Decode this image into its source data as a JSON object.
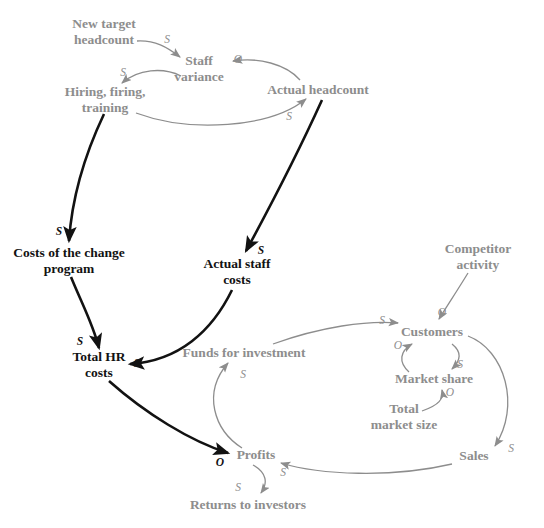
{
  "diagram": {
    "colors": {
      "gray": "#8d8d8d",
      "black": "#121212",
      "background": "#ffffff"
    },
    "nodes": [
      {
        "id": "new-target-headcount",
        "label": "New target\nheadcount",
        "x": 104,
        "y": 32,
        "style": "gray"
      },
      {
        "id": "staff-variance",
        "label": "Staff\nvariance",
        "x": 199,
        "y": 69,
        "style": "gray"
      },
      {
        "id": "actual-headcount",
        "label": "Actual headcount",
        "x": 318,
        "y": 90,
        "style": "gray"
      },
      {
        "id": "hiring-firing-training",
        "label": "Hiring, firing,\ntraining",
        "x": 105,
        "y": 100,
        "style": "gray"
      },
      {
        "id": "costs-of-the-change-program",
        "label": "Costs of the change\nprogram",
        "x": 69,
        "y": 261,
        "style": "black"
      },
      {
        "id": "actual-staff-costs",
        "label": "Actual staff\ncosts",
        "x": 237,
        "y": 272,
        "style": "black"
      },
      {
        "id": "competitor-activity",
        "label": "Competitor\nactivity",
        "x": 478,
        "y": 257,
        "style": "gray"
      },
      {
        "id": "customers",
        "label": "Customers",
        "x": 432,
        "y": 332,
        "style": "gray"
      },
      {
        "id": "funds-for-investment",
        "label": "Funds for investment",
        "x": 244,
        "y": 353,
        "style": "gray"
      },
      {
        "id": "total-hr-costs",
        "label": "Total HR\ncosts",
        "x": 99,
        "y": 365,
        "style": "black"
      },
      {
        "id": "market-share",
        "label": "Market share",
        "x": 434,
        "y": 379,
        "style": "gray"
      },
      {
        "id": "total-market-size",
        "label": "Total\nmarket size",
        "x": 404,
        "y": 417,
        "style": "gray"
      },
      {
        "id": "sales",
        "label": "Sales",
        "x": 474,
        "y": 456,
        "style": "gray"
      },
      {
        "id": "profits",
        "label": "Profits",
        "x": 256,
        "y": 455,
        "style": "gray"
      },
      {
        "id": "returns-to-investors",
        "label": "Returns to investors",
        "x": 248,
        "y": 505,
        "style": "gray"
      }
    ],
    "edges": [
      {
        "id": "new-target-headcount-to-staff-variance",
        "from": "new-target-headcount",
        "to": "staff-variance",
        "polarity": "S",
        "style": "gray",
        "label_x": 167,
        "label_y": 39
      },
      {
        "id": "actual-headcount-to-staff-variance",
        "from": "actual-headcount",
        "to": "staff-variance",
        "polarity": "O",
        "style": "gray",
        "label_x": 238,
        "label_y": 59
      },
      {
        "id": "staff-variance-to-hiring-firing-training",
        "from": "staff-variance",
        "to": "hiring-firing-training",
        "polarity": "S",
        "style": "gray",
        "label_x": 123,
        "label_y": 72
      },
      {
        "id": "hiring-firing-training-to-actual-headcount",
        "from": "hiring-firing-training",
        "to": "actual-headcount",
        "polarity": "S",
        "style": "gray",
        "label_x": 289,
        "label_y": 116
      },
      {
        "id": "hiring-firing-training-to-costs-of-the-change-program",
        "from": "hiring-firing-training",
        "to": "costs-of-the-change-program",
        "polarity": "S",
        "style": "black",
        "label_x": 59,
        "label_y": 231
      },
      {
        "id": "actual-headcount-to-actual-staff-costs",
        "from": "actual-headcount",
        "to": "actual-staff-costs",
        "polarity": "S",
        "style": "black",
        "label_x": 261,
        "label_y": 250
      },
      {
        "id": "costs-of-the-change-program-to-total-hr-costs",
        "from": "costs-of-the-change-program",
        "to": "total-hr-costs",
        "polarity": "S",
        "style": "black",
        "label_x": 80,
        "label_y": 341
      },
      {
        "id": "actual-staff-costs-to-total-hr-costs",
        "from": "actual-staff-costs",
        "to": "total-hr-costs",
        "polarity": "S",
        "style": "black",
        "label_x": 137,
        "label_y": 363
      },
      {
        "id": "total-hr-costs-to-profits",
        "from": "total-hr-costs",
        "to": "profits",
        "polarity": "O",
        "style": "black",
        "label_x": 220,
        "label_y": 462
      },
      {
        "id": "profits-to-funds-for-investment",
        "from": "profits",
        "to": "funds-for-investment",
        "polarity": "S",
        "style": "gray",
        "label_x": 243,
        "label_y": 374
      },
      {
        "id": "funds-for-investment-to-customers",
        "from": "funds-for-investment",
        "to": "customers",
        "polarity": "S",
        "style": "gray",
        "label_x": 382,
        "label_y": 320
      },
      {
        "id": "competitor-activity-to-customers",
        "from": "competitor-activity",
        "to": "customers",
        "polarity": "O",
        "style": "gray",
        "label_x": 442,
        "label_y": 312
      },
      {
        "id": "customers-to-market-share",
        "from": "customers",
        "to": "market-share",
        "polarity": "S",
        "style": "gray",
        "label_x": 460,
        "label_y": 364
      },
      {
        "id": "market-share-to-customers",
        "from": "market-share",
        "to": "customers",
        "polarity": "O",
        "style": "gray",
        "label_x": 398,
        "label_y": 345
      },
      {
        "id": "total-market-size-to-market-share",
        "from": "total-market-size",
        "to": "market-share",
        "polarity": "O",
        "style": "gray",
        "label_x": 450,
        "label_y": 392
      },
      {
        "id": "customers-to-sales",
        "from": "customers",
        "to": "sales",
        "polarity": "S",
        "style": "gray",
        "label_x": 511,
        "label_y": 448
      },
      {
        "id": "sales-to-profits",
        "from": "sales",
        "to": "profits",
        "polarity": "S",
        "style": "gray",
        "label_x": 283,
        "label_y": 472
      },
      {
        "id": "profits-to-returns-to-investors",
        "from": "profits",
        "to": "returns-to-investors",
        "polarity": "S",
        "style": "gray",
        "label_x": 238,
        "label_y": 487
      }
    ]
  }
}
